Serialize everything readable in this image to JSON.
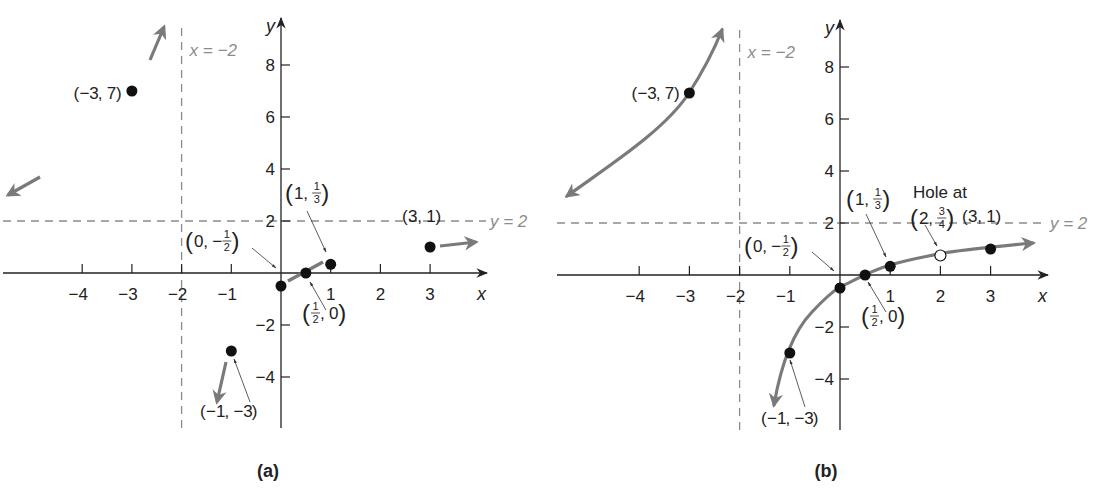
{
  "figure": {
    "panels": [
      {
        "id": "a",
        "label": "(a)",
        "origin_px": [
          281,
          273
        ],
        "px_per_unit_x": 49.7,
        "px_per_unit_y": 26,
        "x_axis": {
          "from_px": 3,
          "to_px": 487,
          "name": "x"
        },
        "y_axis": {
          "from_px": 428,
          "to_px": 18,
          "name": "y"
        },
        "x_ticks": [
          -4,
          -3,
          -2,
          -1,
          1,
          2,
          3
        ],
        "y_ticks": [
          8,
          6,
          4,
          2,
          -2,
          -4
        ],
        "vertical_asymptote": {
          "x": -2,
          "label": "x = −2"
        },
        "horizontal_asymptote": {
          "y": 2,
          "label": "y = 2"
        },
        "points": [
          {
            "x": -3,
            "y": 7,
            "label": "(−3, 7)",
            "filled": true
          },
          {
            "x": -1,
            "y": -3,
            "label": "(−1, −3)",
            "filled": true
          },
          {
            "x": 0,
            "y": -0.5,
            "label": "(0, −1/2)",
            "filled": true
          },
          {
            "x": 0.5,
            "y": 0,
            "label": "(1/2, 0)",
            "filled": true
          },
          {
            "x": 1,
            "y": 0.3333,
            "label": "(1, 1/3)",
            "filled": true
          },
          {
            "x": 3,
            "y": 1,
            "label": "(3, 1)",
            "filled": true
          }
        ],
        "end_behavior_arrows": [
          {
            "direction": "up-near-asymptote",
            "from_px": [
              150,
              60
            ],
            "to_px": [
              164,
              27
            ]
          },
          {
            "direction": "left-toward-y2",
            "from_px": [
              40,
              177
            ],
            "to_px": [
              8,
              195
            ]
          },
          {
            "direction": "down-near-asymptote",
            "from_px": [
              226,
              362
            ],
            "to_px": [
              217,
              402
            ]
          },
          {
            "direction": "right-toward-y2",
            "from_px": [
              440,
              246
            ],
            "to_px": [
              476,
              242
            ]
          }
        ],
        "segment": {
          "from_px": [
            288,
            281
          ],
          "to_px": [
            323,
            262
          ]
        }
      },
      {
        "id": "b",
        "label": "(b)",
        "origin_px": [
          840,
          275
        ],
        "px_per_unit_x": 50.2,
        "px_per_unit_y": 26,
        "x_axis": {
          "from_px": 557,
          "to_px": 1048,
          "name": "x"
        },
        "y_axis": {
          "from_px": 430,
          "to_px": 20,
          "name": "y"
        },
        "x_ticks": [
          -4,
          -3,
          -2,
          -1,
          1,
          2,
          3
        ],
        "y_ticks": [
          8,
          6,
          4,
          2,
          -2,
          -4
        ],
        "vertical_asymptote": {
          "x": -2,
          "label": "x = −2"
        },
        "horizontal_asymptote": {
          "y": 2,
          "label": "y = 2"
        },
        "points": [
          {
            "x": -3,
            "y": 7,
            "label": "(−3, 7)",
            "filled": true
          },
          {
            "x": -1,
            "y": -3,
            "label": "(−1, −3)",
            "filled": true
          },
          {
            "x": 0,
            "y": -0.5,
            "label": "(0, −1/2)",
            "filled": true
          },
          {
            "x": 0.5,
            "y": 0,
            "label": "(1/2, 0)",
            "filled": true
          },
          {
            "x": 1,
            "y": 0.3333,
            "label": "(1, 1/3)",
            "filled": true
          },
          {
            "x": 2,
            "y": 0.75,
            "label": "(2, 3/4)",
            "filled": false,
            "note": "Hole at"
          },
          {
            "x": 3,
            "y": 1,
            "label": "(3, 1)",
            "filled": true
          }
        ],
        "curves": [
          {
            "name": "left-branch",
            "path": "M567,196 C610,165 665,130 689,93 C700,76 712,55 722,30"
          },
          {
            "name": "right-branch",
            "path": "M774,405 C780,370 790,335 812,312 C826,297 835,290 840,287 C855,280 870,271 890,265 C915,258 930,256 938,254 C960,250 990,247 1033,243"
          }
        ]
      }
    ]
  },
  "chart_data": {
    "type": "diagram",
    "panels": [
      {
        "label": "(a)",
        "xlabel": "x",
        "ylabel": "y",
        "xlim": [
          -5,
          4
        ],
        "ylim": [
          -5,
          9
        ],
        "x_ticks": [
          -4,
          -3,
          -2,
          -1,
          1,
          2,
          3
        ],
        "y_ticks": [
          -4,
          -2,
          2,
          4,
          6,
          8
        ],
        "asymptotes": [
          {
            "type": "vertical",
            "equation": "x = −2"
          },
          {
            "type": "horizontal",
            "equation": "y = 2"
          }
        ],
        "points": [
          {
            "x": -3,
            "y": 7
          },
          {
            "x": -1,
            "y": -3
          },
          {
            "x": 0,
            "y": -0.5
          },
          {
            "x": 0.5,
            "y": 0
          },
          {
            "x": 1,
            "y": 0.3333
          },
          {
            "x": 3,
            "y": 1
          }
        ]
      },
      {
        "label": "(b)",
        "xlabel": "x",
        "ylabel": "y",
        "xlim": [
          -5,
          4
        ],
        "ylim": [
          -5,
          9
        ],
        "x_ticks": [
          -4,
          -3,
          -2,
          -1,
          1,
          2,
          3
        ],
        "y_ticks": [
          -4,
          -2,
          2,
          4,
          6,
          8
        ],
        "asymptotes": [
          {
            "type": "vertical",
            "equation": "x = −2"
          },
          {
            "type": "horizontal",
            "equation": "y = 2"
          }
        ],
        "points": [
          {
            "x": -3,
            "y": 7
          },
          {
            "x": -1,
            "y": -3
          },
          {
            "x": 0,
            "y": -0.5
          },
          {
            "x": 0.5,
            "y": 0
          },
          {
            "x": 1,
            "y": 0.3333
          },
          {
            "x": 3,
            "y": 1
          }
        ],
        "holes": [
          {
            "x": 2,
            "y": 0.75,
            "annotation": "Hole at (2, 3/4)"
          }
        ]
      }
    ]
  },
  "colors": {
    "axis": "#222222",
    "asymptote": "#8c8c8c",
    "curve": "#7a7a7a",
    "point": "#111111"
  }
}
